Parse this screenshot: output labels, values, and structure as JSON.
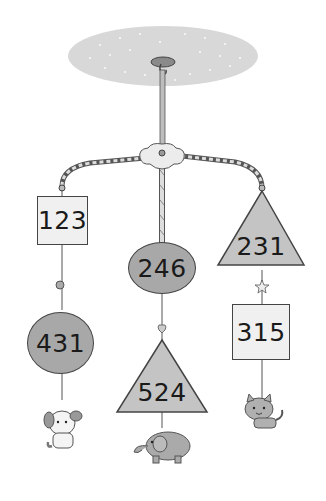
{
  "scene": {
    "description": "Baby mobile with hanging shapes labeled with numbers and animal toys",
    "colors": {
      "ceiling": "#d6d6d6",
      "square_fill": "#f0f0f0",
      "circle_fill": "#a8a8a8",
      "triangle_fill": "#c4c4c4",
      "outline": "#444444"
    }
  },
  "mobile": {
    "left_arm": {
      "top_shape": {
        "type": "square",
        "label": "123"
      },
      "ornament": "bead",
      "bottom_shape": {
        "type": "circle",
        "label": "431"
      },
      "toy": "dog"
    },
    "center_arm": {
      "top_shape": {
        "type": "circle",
        "label": "246"
      },
      "ornament": "heart",
      "bottom_shape": {
        "type": "triangle",
        "label": "524"
      },
      "toy": "elephant"
    },
    "right_arm": {
      "top_shape": {
        "type": "triangle",
        "label": "231"
      },
      "ornament": "star",
      "bottom_shape": {
        "type": "square",
        "label": "315"
      },
      "toy": "cat"
    }
  }
}
